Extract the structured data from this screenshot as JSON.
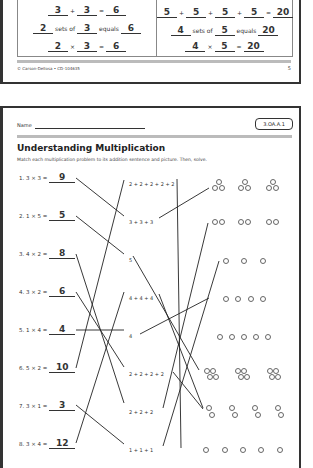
{
  "top_page": {
    "example_left": {
      "addition": {
        "a": "3",
        "op1": "+",
        "b": "3",
        "eq": "=",
        "sum": "6"
      },
      "sets": {
        "n": "2",
        "sets_of": "sets of",
        "size": "3",
        "equals": "equals",
        "total": "6"
      },
      "multiplication": {
        "a": "2",
        "op": "×",
        "b": "3",
        "eq": "=",
        "product": "6"
      }
    },
    "example_right": {
      "addition": {
        "a": "5",
        "b": "5",
        "c": "5",
        "d": "5",
        "op": "+",
        "eq": "=",
        "sum": "20"
      },
      "sets": {
        "n": "4",
        "sets_of": "sets of",
        "size": "5",
        "equals": "equals",
        "total": "20"
      },
      "multiplication": {
        "a": "4",
        "op": "×",
        "b": "5",
        "eq": "=",
        "product": "20"
      }
    },
    "footer_copyright": "© Carson-Dellosa • CD-104635",
    "page_number": "5"
  },
  "worksheet": {
    "name_label": "Name",
    "standard_badge": "3.OA.A.1",
    "title": "Understanding Multiplication",
    "instructions": "Match each multiplication problem to its addition sentence and picture. Then, solve.",
    "problems": [
      {
        "label": "1. 3 × 3 =",
        "answer": "9"
      },
      {
        "label": "2. 1 × 5 =",
        "answer": "5"
      },
      {
        "label": "3. 4 × 2 =",
        "answer": "8"
      },
      {
        "label": "4. 3 × 2 =",
        "answer": "6"
      },
      {
        "label": "5. 1 × 4 =",
        "answer": "4"
      },
      {
        "label": "6. 5 × 2 =",
        "answer": "10"
      },
      {
        "label": "7. 3 × 1 =",
        "answer": "3"
      },
      {
        "label": "8. 3 × 4 =",
        "answer": "12"
      }
    ],
    "addition_sentences": [
      "2 + 2 + 2 + 2 + 2",
      "3 + 3 + 3",
      "5",
      "4 + 4 + 4",
      "4",
      "2 + 2 + 2 + 2",
      "2 + 2 + 2",
      "1 + 1 + 1"
    ],
    "pictures": [
      "3 groups of 3 circles",
      "3 groups of 2 circles",
      "3 single circles",
      "4 single circles",
      "5 single circles",
      "3 groups of 4 circles",
      "4 groups of 2 circles",
      "5 single circles"
    ]
  }
}
